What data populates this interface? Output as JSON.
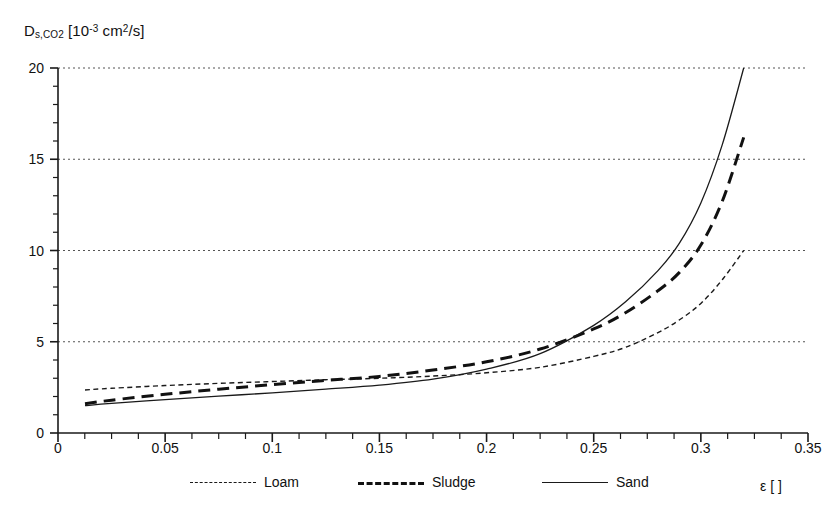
{
  "chart_data": {
    "type": "line",
    "title": "",
    "ylabel": "D_s,CO2 [10^-3 cm^2/s]",
    "ylabel_parts": {
      "symbol": "D",
      "subscript": "s,CO",
      "subscript2": "2",
      "unit_open": " [10",
      "unit_exp": "-3",
      "unit_mid": " cm",
      "unit_exp2": "2",
      "unit_close": "/s]"
    },
    "xlabel": "ε [ ]",
    "xlim": [
      0,
      0.35
    ],
    "ylim": [
      0,
      20
    ],
    "grid": "horizontal-dotted-major-y",
    "legend_position": "bottom-center-outside",
    "x_major_ticks": [
      0,
      0.05,
      0.1,
      0.15,
      0.2,
      0.25,
      0.3,
      0.35
    ],
    "x_tick_labels": [
      "0",
      "0.05",
      "0.1",
      "0.15",
      "0.2",
      "0.25",
      "0.3",
      "0.35"
    ],
    "x_minor_step": 0.0125,
    "y_major_ticks": [
      0,
      5,
      10,
      15,
      20
    ],
    "y_tick_labels": [
      "0",
      "5",
      "10",
      "15",
      "20"
    ],
    "y_minor_step": 1,
    "series": [
      {
        "name": "Loam",
        "style": "fine-dashed",
        "linewidth": 1.4,
        "color": "#1a1a1a",
        "x": [
          0.0126,
          0.025,
          0.05,
          0.075,
          0.1,
          0.125,
          0.15,
          0.175,
          0.2,
          0.225,
          0.25,
          0.265,
          0.28,
          0.29,
          0.3,
          0.31,
          0.32
        ],
        "y": [
          2.36,
          2.45,
          2.6,
          2.72,
          2.82,
          2.92,
          3.0,
          3.12,
          3.3,
          3.6,
          4.2,
          4.7,
          5.5,
          6.2,
          7.1,
          8.4,
          10.0
        ]
      },
      {
        "name": "Sludge",
        "style": "coarse-dashed",
        "linewidth": 3.0,
        "color": "#111111",
        "x": [
          0.0126,
          0.025,
          0.05,
          0.075,
          0.1,
          0.125,
          0.15,
          0.175,
          0.2,
          0.225,
          0.25,
          0.265,
          0.28,
          0.29,
          0.3,
          0.31,
          0.32
        ],
        "y": [
          1.6,
          1.8,
          2.12,
          2.4,
          2.65,
          2.88,
          3.1,
          3.45,
          3.9,
          4.6,
          5.7,
          6.6,
          7.8,
          8.8,
          10.3,
          12.7,
          16.2
        ]
      },
      {
        "name": "Sand",
        "style": "solid",
        "linewidth": 1.3,
        "color": "#1a1a1a",
        "x": [
          0.0126,
          0.025,
          0.05,
          0.075,
          0.1,
          0.125,
          0.15,
          0.175,
          0.2,
          0.225,
          0.25,
          0.265,
          0.28,
          0.29,
          0.3,
          0.31,
          0.32
        ],
        "y": [
          1.5,
          1.62,
          1.83,
          2.02,
          2.2,
          2.4,
          2.62,
          2.95,
          3.5,
          4.35,
          5.9,
          7.2,
          8.9,
          10.4,
          12.6,
          15.8,
          20.0
        ]
      }
    ],
    "annotations": [
      "All three curves intersect near ε ≈ 0.235 at D ≈ 5"
    ]
  },
  "legend": {
    "items": [
      {
        "label": "Loam"
      },
      {
        "label": "Sludge"
      },
      {
        "label": "Sand"
      }
    ]
  }
}
